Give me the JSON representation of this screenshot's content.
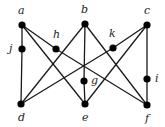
{
  "diagram": {
    "type": "graph",
    "nodes": [
      {
        "id": "a",
        "label": "a",
        "x": 22,
        "y": 25,
        "lx": 18,
        "ly": 14
      },
      {
        "id": "b",
        "label": "b",
        "x": 85,
        "y": 24,
        "lx": 81,
        "ly": 13
      },
      {
        "id": "c",
        "label": "c",
        "x": 147,
        "y": 25,
        "lx": 144,
        "ly": 14
      },
      {
        "id": "j",
        "label": "j",
        "x": 22,
        "y": 49,
        "lx": 9,
        "ly": 52
      },
      {
        "id": "h",
        "label": "h",
        "x": 56,
        "y": 49,
        "lx": 53,
        "ly": 38
      },
      {
        "id": "k",
        "label": "k",
        "x": 113,
        "y": 48,
        "lx": 109,
        "ly": 37
      },
      {
        "id": "g",
        "label": "g",
        "x": 84,
        "y": 81,
        "lx": 91,
        "ly": 84
      },
      {
        "id": "i",
        "label": "i",
        "x": 147,
        "y": 79,
        "lx": 155,
        "ly": 82
      },
      {
        "id": "d",
        "label": "d",
        "x": 21,
        "y": 104,
        "lx": 18,
        "ly": 121
      },
      {
        "id": "e",
        "label": "e",
        "x": 85,
        "y": 104,
        "lx": 82,
        "ly": 121
      },
      {
        "id": "f",
        "label": "f",
        "x": 147,
        "y": 105,
        "lx": 145,
        "ly": 122
      }
    ],
    "edges": [
      [
        "a",
        "j"
      ],
      [
        "j",
        "d"
      ],
      [
        "a",
        "h"
      ],
      [
        "h",
        "f"
      ],
      [
        "a",
        "e"
      ],
      [
        "b",
        "d"
      ],
      [
        "b",
        "g"
      ],
      [
        "g",
        "e"
      ],
      [
        "b",
        "f"
      ],
      [
        "c",
        "k"
      ],
      [
        "k",
        "d"
      ],
      [
        "c",
        "e"
      ],
      [
        "c",
        "i"
      ],
      [
        "i",
        "f"
      ]
    ]
  }
}
